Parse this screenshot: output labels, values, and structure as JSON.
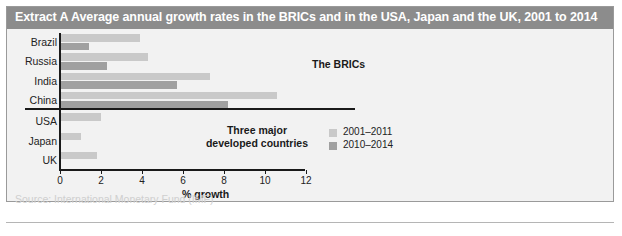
{
  "header": {
    "title": "Extract A Average annual growth rates in the BRICs and in the USA, Japan and the UK, 2001 to 2014"
  },
  "annotations": {
    "brics_group": "The BRICs",
    "developed_group_line1": "Three major",
    "developed_group_line2": "developed countries"
  },
  "source": "Source: International Monetary Fund (IMF)",
  "colors": {
    "header_background": "#8c8c8c",
    "header_text": "#ffffff",
    "panel_background": "#f2f2f2",
    "series_2001_2011": "#c9c9c9",
    "series_2010_2014": "#a0a0a0",
    "axis": "#1a1a1a",
    "source_text": "#cfcfcf"
  },
  "chart_data": {
    "type": "bar",
    "orientation": "horizontal",
    "title": "Extract A Average annual growth rates in the BRICs and in the USA, Japan and the UK, 2001 to 2014",
    "xlabel": "% growth",
    "ylabel": "",
    "xlim": [
      0,
      12
    ],
    "xticks": [
      0,
      2,
      4,
      6,
      8,
      10,
      12
    ],
    "xtick_labels": [
      "0",
      "2",
      "4",
      "6",
      "8",
      "10",
      "12"
    ],
    "grid": false,
    "legend_position": "center-right-inside",
    "categories": [
      "Brazil",
      "Russia",
      "India",
      "China",
      "USA",
      "Japan",
      "UK"
    ],
    "groups": [
      {
        "name": "The BRICs",
        "categories": [
          "Brazil",
          "Russia",
          "India",
          "China"
        ]
      },
      {
        "name": "Three major developed countries",
        "categories": [
          "USA",
          "Japan",
          "UK"
        ]
      }
    ],
    "series": [
      {
        "name": "2001–2011",
        "color": "#c9c9c9",
        "values": [
          3.9,
          4.3,
          7.3,
          10.6,
          2.0,
          1.0,
          1.8
        ]
      },
      {
        "name": "2010–2014",
        "color": "#a0a0a0",
        "values": [
          1.4,
          2.3,
          5.7,
          8.2,
          0.0,
          0.0,
          0.0
        ]
      }
    ]
  }
}
